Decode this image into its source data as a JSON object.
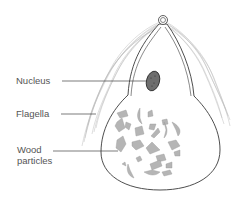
{
  "diagram": {
    "labels": {
      "nucleus": "Nucleus",
      "flagella": "Flagella",
      "wood_particles": "Wood particles"
    },
    "colors": {
      "outline": "#3a3a3a",
      "flagella": "#b8b8b8",
      "nucleus_fill": "#6e6e6e",
      "particle_fill": "#b5b5b5",
      "label_text": "#555555",
      "leader_line": "#444444"
    }
  }
}
